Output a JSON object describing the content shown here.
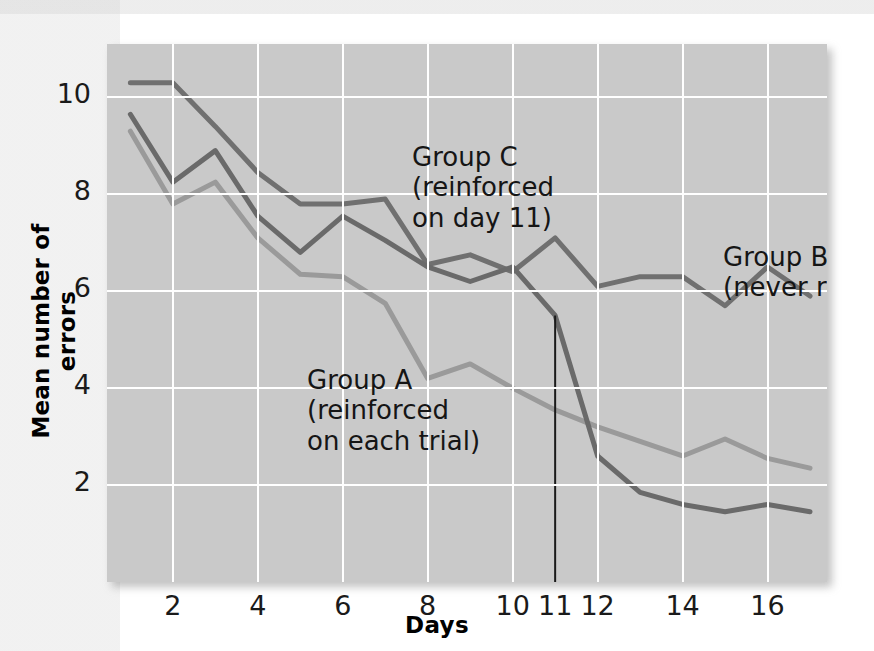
{
  "figure": {
    "background_color": "#ffffff",
    "plot_background_color": "#c9c9c9",
    "gridline_color": "#ffffff"
  },
  "chart_data": {
    "type": "line",
    "title": "",
    "xlabel": "Days",
    "ylabel": "Mean number of errors",
    "xlim": [
      0.45,
      17.4
    ],
    "ylim": [
      0,
      11.1
    ],
    "xticks": [
      2,
      4,
      6,
      8,
      10,
      11,
      12,
      14,
      16
    ],
    "xtick_labels": [
      "2",
      "4",
      "6",
      "8",
      "10",
      "11",
      "12",
      "14",
      "16"
    ],
    "yticks": [
      2,
      4,
      6,
      8,
      10
    ],
    "ytick_labels": [
      "2",
      "4",
      "6",
      "8",
      "10"
    ],
    "grid": true,
    "grid_x_values": [
      2,
      4,
      6,
      8,
      10,
      12,
      14,
      16
    ],
    "grid_y_values": [
      2,
      4,
      6,
      8,
      10
    ],
    "legend_position": "inline-annotations",
    "x": [
      1,
      2,
      3,
      4,
      5,
      6,
      7,
      8,
      9,
      10,
      11,
      12,
      13,
      14,
      15,
      16,
      17
    ],
    "series": [
      {
        "name": "Group A",
        "description": "reinforced on each trial",
        "color": "#9a9a9a",
        "line_width": 5,
        "values": [
          9.3,
          7.8,
          8.25,
          7.1,
          6.35,
          6.3,
          5.75,
          4.2,
          4.5,
          4.0,
          3.55,
          3.2,
          2.9,
          2.6,
          2.95,
          2.55,
          2.35
        ]
      },
      {
        "name": "Group B",
        "description": "never reinforced",
        "color": "#707070",
        "line_width": 5,
        "values": [
          10.3,
          10.3,
          9.4,
          8.45,
          7.8,
          7.8,
          7.9,
          6.55,
          6.75,
          6.4,
          7.1,
          6.1,
          6.3,
          6.3,
          5.7,
          6.5,
          5.9
        ]
      },
      {
        "name": "Group C",
        "description": "reinforced on day 11",
        "color": "#6a6a6a",
        "line_width": 5,
        "values": [
          9.65,
          8.25,
          8.9,
          7.55,
          6.8,
          7.55,
          7.05,
          6.5,
          6.2,
          6.5,
          5.5,
          2.6,
          1.85,
          1.6,
          1.45,
          1.6,
          1.45
        ]
      }
    ],
    "annotations": [
      {
        "id": "group-c",
        "lines": [
          "Group C",
          "(reinforced",
          "on day 11)"
        ],
        "text_x": 305,
        "text_y": 98,
        "leader": [
          [
            255,
            113
          ],
          [
            282,
            113
          ]
        ],
        "leader_tail": [
          [
            255,
            113
          ],
          [
            196,
            175
          ]
        ]
      },
      {
        "id": "group-b",
        "lines": [
          "Group B",
          "(never reinforced)"
        ],
        "text_x": 616,
        "text_y": 198,
        "leader": [
          [
            570,
            213
          ],
          [
            597,
            213
          ]
        ],
        "leader_tail": [
          [
            570,
            213
          ],
          [
            537,
            252
          ]
        ]
      },
      {
        "id": "group-a",
        "lines": [
          "Group A",
          "(reinforced",
          "on each trial)"
        ],
        "text_x": 200,
        "text_y": 321,
        "leader": [
          [
            327,
            335
          ],
          [
            347,
            335
          ]
        ],
        "leader_tail": [
          [
            347,
            335
          ],
          [
            382,
            301
          ]
        ]
      }
    ],
    "reference_line": {
      "label": "day 11",
      "x_value": 11,
      "color": "#1a1a1a",
      "width": 2
    }
  }
}
